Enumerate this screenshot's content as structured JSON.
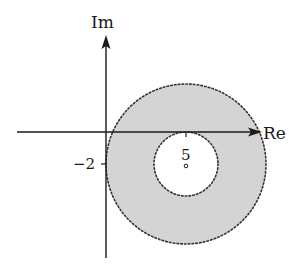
{
  "diagram": {
    "type": "complex-plane-annulus",
    "axes": {
      "imaginary_label": "Im",
      "real_label": "Re"
    },
    "ticks": {
      "real_tick_label": "5",
      "imaginary_tick_label": "−2"
    },
    "region": {
      "description": "Open annulus centered at 5 − 2i, shaded gray, bounded by dotted circles",
      "center": "5 − 2i",
      "fill_color": "#d4d4d4",
      "boundary_style": "dotted",
      "boundary_color": "#333333"
    },
    "colors": {
      "axis": "#1a1a1a",
      "shade": "#d4d4d4",
      "background": "#ffffff"
    }
  }
}
